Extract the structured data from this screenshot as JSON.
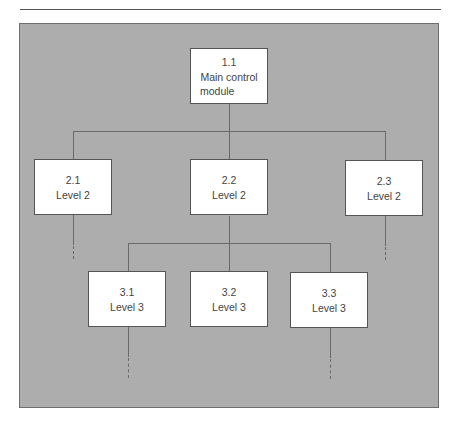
{
  "diagram": {
    "type": "hierarchy",
    "nodes": [
      {
        "id": "1.1",
        "number": "1.1",
        "label": "Main control module",
        "label_lines": [
          "Main control",
          "module"
        ],
        "level": 1
      },
      {
        "id": "2.1",
        "number": "2.1",
        "label": "Level 2",
        "level": 2,
        "parent": "1.1"
      },
      {
        "id": "2.2",
        "number": "2.2",
        "label": "Level 2",
        "level": 2,
        "parent": "1.1"
      },
      {
        "id": "2.3",
        "number": "2.3",
        "label": "Level 2",
        "level": 2,
        "parent": "1.1"
      },
      {
        "id": "3.1",
        "number": "3.1",
        "label": "Level 3",
        "level": 3,
        "parent": "2.2"
      },
      {
        "id": "3.2",
        "number": "3.2",
        "label": "Level 3",
        "level": 3,
        "parent": "2.2"
      },
      {
        "id": "3.3",
        "number": "3.3",
        "label": "Level 3",
        "level": 3,
        "parent": "2.2"
      }
    ],
    "continuation_dashes_below": [
      "2.1",
      "2.3",
      "3.1",
      "3.3"
    ],
    "colors": {
      "panel": "#adadad",
      "box": "#ffffff",
      "line": "#6a6a6a"
    }
  }
}
